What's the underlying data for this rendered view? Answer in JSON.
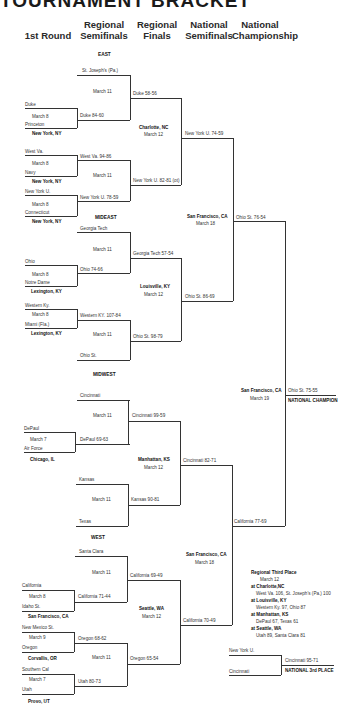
{
  "title": "TOURNAMENT BRACKET",
  "columns": [
    "1st Round",
    "Regional Semifinals",
    "Regional Finals",
    "National Semifinals",
    "National Championship"
  ],
  "column_lines": {
    "regional_semifinals": [
      "Regional",
      "Semifinals"
    ],
    "regional_finals": [
      "Regional",
      "Finals"
    ],
    "national_semifinals": [
      "National",
      "Semifinals"
    ],
    "national_championship": [
      "National",
      "Championship"
    ]
  },
  "regions": {
    "east": "EAST",
    "mideast": "MIDEAST",
    "midwest": "MIDWEST",
    "west": "WEST"
  },
  "east": {
    "bye_team": "St. Joseph's (Pa.)",
    "rs_date": "March 11",
    "g1": {
      "top": "Duke",
      "date": "March 8",
      "bottom": "Princeton",
      "site": "New York, NY",
      "result": "Duke 84-60"
    },
    "g2": {
      "top": "West Va.",
      "date": "March 8",
      "bottom": "Navy",
      "site": "New York, NY",
      "result": "West Va. 94-86"
    },
    "rs2_date": "March 11",
    "g3": {
      "top": "New York U.",
      "date": "March 8",
      "bottom": "Connecticut",
      "site": "New York, NY",
      "result": "New York U. 78-59"
    },
    "rs1_result": "Duke 58-56",
    "rs2_result": "New York U. 82-81 (ot)",
    "rf_site": "Charlotte, NC",
    "rf_date": "March 12",
    "rf_result": "New York U. 74-59"
  },
  "mideast": {
    "bye_team": "Georgia Tech",
    "rs_date": "March 11",
    "g1": {
      "top": "Ohio",
      "date": "March 8",
      "bottom": "Notre Dame",
      "site": "Lexington, KY",
      "result": "Ohio 74-66"
    },
    "rs1_result": "Georgia Tech 57-54",
    "rf_site": "Louisville, KY",
    "rf_date": "March 12",
    "g2": {
      "top": "Western Ky.",
      "date": "March 8",
      "bottom": "Miami (Fla.)",
      "site": "Lexington, KY",
      "result": "Western KY. 107-84"
    },
    "rs2_date": "March 11",
    "bye_team2": "Ohio St.",
    "rs2_result": "Ohio St. 98-79",
    "rf_result": "Ohio St. 86-69"
  },
  "national_semi_1": {
    "site": "San Francisco, CA",
    "date": "March 18",
    "result": "Ohio St. 76-54"
  },
  "final": {
    "site": "San Francisco, CA",
    "date": "March 19",
    "result": "Ohio St. 75-55",
    "label": "NATIONAL CHAMPION"
  },
  "midwest": {
    "bye_team": "Cincinnati",
    "rs_date": "March 11",
    "g1": {
      "top": "DePaul",
      "date": "March 7",
      "bottom": "Air Force",
      "site": "Chicago, IL",
      "result": "DePaul 69-63"
    },
    "rs1_result": "Cincinnati 99-59",
    "rf_site": "Manhattan, KS",
    "rf_date": "March 12",
    "rf_result": "Cincinnati 82-71",
    "bye_team2": "Kansas",
    "rs2_date": "March 11",
    "bye_team3": "Texas",
    "rs2_result": "Kansas 90-81"
  },
  "west": {
    "bye_team": "Santa Clara",
    "rs_date": "March 11",
    "g1": {
      "top": "California",
      "date": "March 8",
      "bottom": "Idaho St.",
      "site": "San Francisco, CA",
      "result": "California 71-44"
    },
    "rs1_result": "California 69-49",
    "rf_site": "Seattle, WA",
    "rf_date": "March 12",
    "g2": {
      "top": "New Mexico St.",
      "date": "March 9",
      "bottom": "Oregon",
      "site": "Corvallis, OR",
      "result": "Oregon 68-62"
    },
    "rs2_date": "March 11",
    "g3": {
      "top": "Southern Cal",
      "date": "March 7",
      "bottom": "Utah",
      "site": "Provo, UT",
      "result": "Utah 80-73"
    },
    "rs2_result": "Oregon 65-54",
    "rf_result": "California 70-49"
  },
  "national_semi_2": {
    "site": "San Francisco, CA",
    "date": "March 18",
    "result": "California 77-69"
  },
  "third_place_regional": {
    "heading": "Regional Third Place",
    "date": "March 12",
    "entries": [
      {
        "site": "at Charlotte,NC",
        "result": "West Va. 106, St. Joseph's (Pa.) 100"
      },
      {
        "site": "at Louisville, KY",
        "result": "Western Ky. 97, Ohio 87"
      },
      {
        "site": "at Manhattan, KS",
        "result": "DePaul 67, Texas 61"
      },
      {
        "site": "at Seattle, WA",
        "result": "Utah 89, Santa Clara 81"
      }
    ]
  },
  "national_third": {
    "top": "New York U.",
    "bottom": "Cincinnati",
    "result": "Cincinnati 95-71",
    "label": "NATIONAL 3rd PLACE"
  }
}
